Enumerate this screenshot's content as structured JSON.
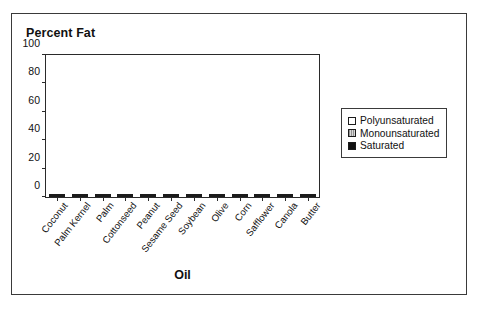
{
  "chart_data": {
    "type": "bar",
    "stacked": true,
    "title": "Percent Fat",
    "xlabel": "Oil",
    "ylabel": "",
    "ylim": [
      0,
      100
    ],
    "yticks": [
      0,
      20,
      40,
      60,
      80,
      100
    ],
    "ytick_labels": [
      "0",
      "20",
      "40",
      "60",
      "80",
      "100"
    ],
    "grid": false,
    "legend_position": "right",
    "categories": [
      "Coconut",
      "Palm Kernel",
      "Palm",
      "Cottonseed",
      "Peanut",
      "Sesame Seed",
      "Soybean",
      "Olive",
      "Corn",
      "Safflower",
      "Canola",
      "Butter"
    ],
    "series": [
      {
        "name": "Saturated",
        "color": "#111111",
        "values": [
          86.5,
          81,
          50,
          26,
          19,
          15,
          14.5,
          14,
          13,
          9,
          6,
          50
        ]
      },
      {
        "name": "Monounsaturated",
        "color": "#d8d8d8",
        "values": [
          5.5,
          11,
          42,
          19,
          46,
          39.5,
          23,
          71,
          23.5,
          11.5,
          55,
          22
        ]
      },
      {
        "name": "Polyunsaturated",
        "color": "#ffffff",
        "values": [
          1.5,
          2,
          4,
          51,
          30,
          40,
          58,
          9,
          59.5,
          73.5,
          33,
          7
        ]
      }
    ],
    "cumulative_tops": {
      "saturated": [
        86.5,
        81,
        50,
        26,
        19,
        15,
        14.5,
        14,
        13,
        9,
        6,
        50
      ],
      "monounsaturated": [
        92,
        92,
        92,
        45,
        65,
        54.5,
        37.5,
        85,
        36.5,
        20.5,
        61,
        72
      ],
      "total": [
        93.5,
        94,
        96,
        96,
        95,
        94.5,
        95.5,
        94,
        96,
        94,
        94,
        79
      ]
    }
  },
  "legend": {
    "items": [
      {
        "label": "Polyunsaturated",
        "swatch": "poly"
      },
      {
        "label": "Monounsaturated",
        "swatch": "mono"
      },
      {
        "label": "Saturated",
        "swatch": "sat"
      }
    ]
  }
}
